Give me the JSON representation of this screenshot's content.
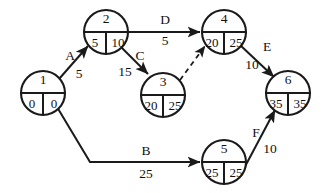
{
  "diagram": {
    "type": "activity-on-arrow-network",
    "title": "",
    "background_color": "#ffffff",
    "line_color": "#1a1a1a",
    "text_color": "#111111",
    "node_radius": 22,
    "nodes": [
      {
        "id": "1",
        "label": "1",
        "earliest": "0",
        "latest": "0",
        "cx": 43,
        "cy": 93
      },
      {
        "id": "2",
        "label": "2",
        "earliest": "5",
        "latest": "10",
        "cx": 106,
        "cy": 32
      },
      {
        "id": "3",
        "label": "3",
        "earliest": "20",
        "latest": "25",
        "cx": 163,
        "cy": 95
      },
      {
        "id": "4",
        "label": "4",
        "earliest": "20",
        "latest": "25",
        "cx": 224,
        "cy": 32
      },
      {
        "id": "5",
        "label": "5",
        "earliest": "25",
        "latest": "25",
        "cx": 224,
        "cy": 162
      },
      {
        "id": "6",
        "label": "6",
        "earliest": "35",
        "latest": "35",
        "cx": 288,
        "cy": 93
      }
    ],
    "edges": [
      {
        "name": "A",
        "from": "1",
        "to": "2",
        "duration": "5",
        "style": "solid",
        "label_x": 70,
        "label_y": 57,
        "duration_x": 79,
        "duration_y": 75
      },
      {
        "name": "C",
        "from": "2",
        "to": "3",
        "duration": "15",
        "style": "solid",
        "label_x": 140,
        "label_y": 57,
        "duration_x": 125,
        "duration_y": 73
      },
      {
        "name": "D",
        "from": "2",
        "to": "4",
        "duration": "5",
        "style": "solid",
        "label_x": 165,
        "label_y": 21,
        "duration_x": 165,
        "duration_y": 42
      },
      {
        "name": "",
        "from": "3",
        "to": "4",
        "duration": "",
        "style": "dashed",
        "label_x": 0,
        "label_y": 0,
        "duration_x": 0,
        "duration_y": 0
      },
      {
        "name": "E",
        "from": "4",
        "to": "6",
        "duration": "10",
        "style": "solid",
        "label_x": 267,
        "label_y": 48,
        "duration_x": 252,
        "duration_y": 66
      },
      {
        "name": "B",
        "from": "1",
        "to": "5",
        "duration": "25",
        "style": "solid",
        "label_x": 146,
        "label_y": 152,
        "duration_x": 146,
        "duration_y": 175
      },
      {
        "name": "F",
        "from": "5",
        "to": "6",
        "duration": "10",
        "style": "solid",
        "label_x": 256,
        "label_y": 134,
        "duration_x": 270,
        "duration_y": 150
      }
    ]
  }
}
